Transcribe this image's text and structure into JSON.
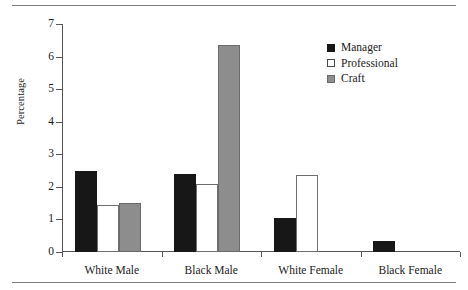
{
  "chart_data": {
    "type": "bar",
    "title": "",
    "xlabel": "",
    "ylabel": "Percentage",
    "ylim": [
      0,
      7
    ],
    "yticks": [
      0,
      1,
      2,
      3,
      4,
      5,
      6,
      7
    ],
    "grid": false,
    "legend_position": "top-right",
    "categories": [
      "White Male",
      "Black Male",
      "White Female",
      "Black Female"
    ],
    "series": [
      {
        "name": "Manager",
        "color": "#171717",
        "values": [
          2.5,
          2.4,
          1.05,
          0.33
        ]
      },
      {
        "name": "Professional",
        "color": "#ffffff",
        "values": [
          1.45,
          2.1,
          2.35,
          0
        ]
      },
      {
        "name": "Craft",
        "color": "#8d8d8d",
        "values": [
          1.5,
          6.35,
          0,
          0
        ]
      }
    ]
  },
  "legend": {
    "items": [
      {
        "label": "Manager",
        "swatch": "manager"
      },
      {
        "label": "Professional",
        "swatch": "professional"
      },
      {
        "label": "Craft",
        "swatch": "craft"
      }
    ]
  },
  "colors": {
    "manager": "#171717",
    "professional": "#ffffff",
    "craft": "#8d8d8d",
    "axis": "#555555",
    "rule": "#7d7d7d"
  }
}
